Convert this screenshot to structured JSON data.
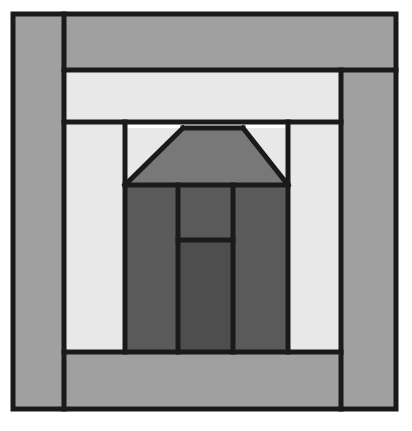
{
  "document": {
    "title": "Schoolhouse Log Cabin Quilt Block",
    "width": 412,
    "height": 431,
    "background": "#ffffff"
  },
  "palette": {
    "outline": "#1a1a1a",
    "light": "#e8e8e8",
    "medium": "#a0a0a0",
    "roof": "#787878",
    "dark": "#5a5a5a",
    "door": "#4e4e4e",
    "page_background": "#ffffff"
  },
  "geometry": {
    "block_left": 13,
    "block_top": 14,
    "block_right": 396,
    "block_bottom": 409,
    "sash_left": 64,
    "sash_right": 341,
    "sash_top": 70,
    "sash_bottom": 352,
    "inner_left": 76,
    "inner_right": 305,
    "inner_top": 122,
    "inner_bottom": 352,
    "house_left": 125,
    "house_right": 288,
    "roof_top": 128,
    "roof_base": 185,
    "roof_peak_left": 183,
    "roof_peak_right": 243,
    "wall_split_left": 178,
    "wall_split_right": 233,
    "door_top": 240,
    "stroke_width": 5
  },
  "shapes": [
    {
      "id": "border-left-strip",
      "name": "border-left-strip",
      "label": "Left border log",
      "fill": "medium",
      "points": "13,14 64,14 64,409 13,409"
    },
    {
      "id": "border-top-strip",
      "name": "border-top-strip",
      "label": "Top border log",
      "fill": "medium",
      "points": "64,14 396,14 396,70 64,70"
    },
    {
      "id": "border-right-strip",
      "name": "border-right-strip",
      "label": "Right border log",
      "fill": "medium",
      "points": "341,70 396,70 396,409 341,409"
    },
    {
      "id": "border-bottom-strip",
      "name": "border-bottom-strip",
      "label": "Bottom border log",
      "fill": "medium",
      "points": "64,352 341,352 341,409 64,409"
    },
    {
      "id": "sash-top-strip",
      "name": "sash-top-strip",
      "label": "Upper light sash",
      "fill": "light",
      "points": "64,70 341,70 341,122 64,122"
    },
    {
      "id": "sash-left-strip",
      "name": "sash-left-strip",
      "label": "Left light sash",
      "fill": "light",
      "points": "64,122 125,122 125,352 64,352"
    },
    {
      "id": "sash-right-strip",
      "name": "sash-right-strip",
      "label": "Right light sash",
      "fill": "light",
      "points": "288,122 341,122 341,352 288,352"
    },
    {
      "id": "sky-left-triangle",
      "name": "sky-left-triangle",
      "label": "Left sky triangle",
      "fill": "light",
      "points": "125,128 183,128 125,185"
    },
    {
      "id": "sky-right-triangle",
      "name": "sky-right-triangle",
      "label": "Right sky triangle",
      "fill": "light",
      "points": "243,128 288,128 288,185"
    },
    {
      "id": "roof-trapezoid",
      "name": "roof-trapezoid",
      "label": "Roof",
      "fill": "roof",
      "points": "183,128 243,128 288,185 125,185"
    },
    {
      "id": "wall-left-panel",
      "name": "wall-left-panel",
      "label": "Left wall panel",
      "fill": "dark",
      "points": "125,185 178,185 178,352 125,352"
    },
    {
      "id": "wall-right-panel",
      "name": "wall-right-panel",
      "label": "Right wall panel",
      "fill": "dark",
      "points": "233,185 288,185 288,352 233,352"
    },
    {
      "id": "transom-panel",
      "name": "transom-panel",
      "label": "Transom over door",
      "fill": "dark",
      "points": "178,185 233,185 233,240 178,240"
    },
    {
      "id": "door-panel",
      "name": "door-panel",
      "label": "Door",
      "fill": "door",
      "points": "178,240 233,240 233,352 178,352"
    }
  ],
  "outlines": [
    {
      "name": "block-outer-frame",
      "points": "13,14 396,14 396,409 13,409 13,14"
    },
    {
      "name": "border-left-edge",
      "points": "64,14 64,409"
    },
    {
      "name": "sash-top-edge",
      "points": "64,70 396,70"
    },
    {
      "name": "sash-bottom-edge",
      "points": "64,122 341,122"
    },
    {
      "name": "border-right-edge",
      "points": "341,70 341,409"
    },
    {
      "name": "border-bottom-edge",
      "points": "64,352 341,352"
    },
    {
      "name": "house-left-edge",
      "points": "125,122 125,352"
    },
    {
      "name": "house-right-edge",
      "points": "288,122 288,352"
    },
    {
      "name": "roof-top-edge",
      "points": "183,128 243,128"
    },
    {
      "name": "roof-left-slope",
      "points": "183,128 125,185"
    },
    {
      "name": "roof-right-slope",
      "points": "243,128 288,185"
    },
    {
      "name": "roof-base-edge",
      "points": "125,185 288,185"
    },
    {
      "name": "wall-split-left-edge",
      "points": "178,185 178,352"
    },
    {
      "name": "wall-split-right-edge",
      "points": "233,185 233,352"
    },
    {
      "name": "door-transom-edge",
      "points": "178,240 233,240"
    }
  ]
}
